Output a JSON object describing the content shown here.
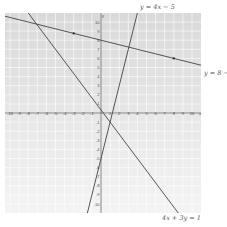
{
  "chart_data": {
    "type": "line",
    "title": "",
    "xlabel": "x",
    "ylabel": "y",
    "xlim": [
      -10,
      11
    ],
    "ylim": [
      -11,
      11
    ],
    "grid": true,
    "x_ticks": [
      -10,
      -9,
      -8,
      -7,
      -6,
      -5,
      -4,
      -3,
      -2,
      -1,
      1,
      2,
      3,
      4,
      5,
      6,
      7,
      8,
      9,
      10
    ],
    "y_ticks": [
      -10,
      -9,
      -8,
      -7,
      -6,
      -5,
      -4,
      -3,
      -2,
      -1,
      1,
      2,
      3,
      4,
      5,
      6,
      7,
      8,
      9,
      10
    ],
    "series": [
      {
        "name": "y = 4x − 5",
        "equation": "y = 4x - 5",
        "slope": 4,
        "intercept": -5
      },
      {
        "name": "y = 8 − ¼x",
        "equation": "y = 8 - x/4",
        "slope": -0.25,
        "intercept": 8,
        "marked_points": [
          [
            -3,
            8.75
          ],
          [
            8,
            6
          ]
        ]
      },
      {
        "name": "4x + 3y = 1",
        "equation": "y = (1 - 4x)/3",
        "slope": -1.3333,
        "intercept": 0.3333
      }
    ]
  },
  "labels": {
    "line1": "y = 4x − 5",
    "line2": "y = 8 − ¼",
    "line3": "4x + 3y = 1",
    "x_axis": "x",
    "y_axis": "y"
  }
}
